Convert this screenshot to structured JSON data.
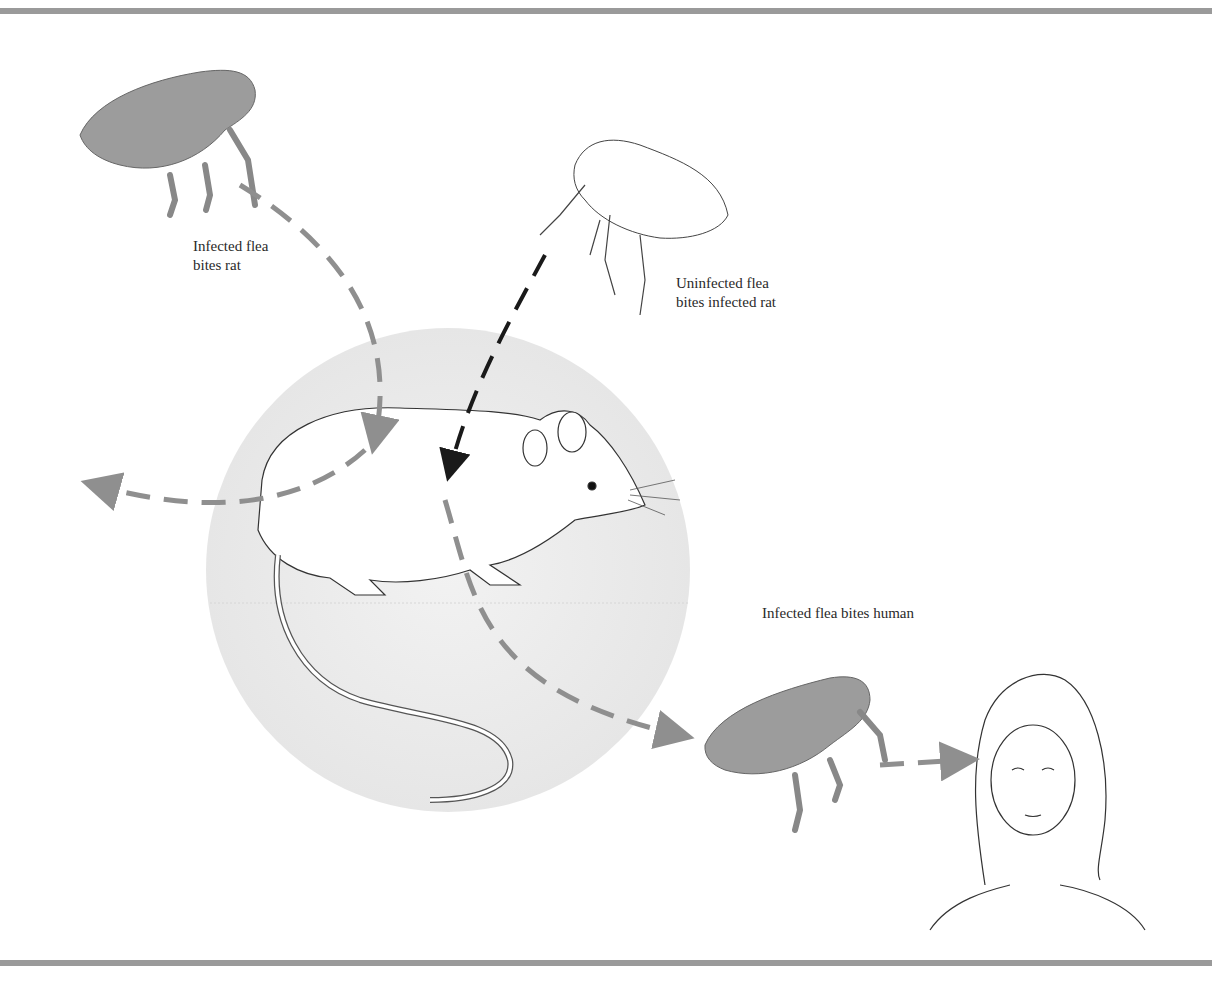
{
  "figure": {
    "labels": {
      "infected_flea_bites_rat_line1": "Infected flea",
      "infected_flea_bites_rat_line2": "bites rat",
      "uninfected_flea_line1": "Uninfected flea",
      "uninfected_flea_line2": "bites infected rat",
      "infected_flea_bites_human": "Infected flea bites human"
    },
    "colors": {
      "infected_arrow": "#8f8f8f",
      "uninfected_arrow": "#1a1a1a",
      "infected_flea_fill": "#9c9c9c",
      "circle_background": "#ececec",
      "rule": "#9a9a9a"
    }
  }
}
